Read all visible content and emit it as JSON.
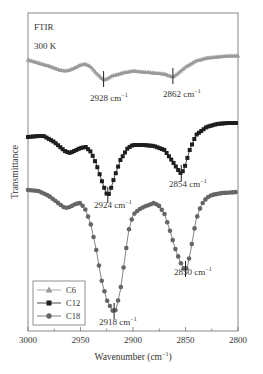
{
  "chart_data": {
    "type": "line",
    "title": "FTIR",
    "subtitle": "300 K",
    "xlabel": "Wavenumber (cm−1)",
    "ylabel": "Transmittance",
    "xlim": [
      3000,
      2800
    ],
    "x_reversed": true,
    "x_ticks": [
      3000,
      2950,
      2900,
      2850,
      2800
    ],
    "x_minor_step": 25,
    "grid": false,
    "legend_position": "lower left",
    "legend": [
      "C6",
      "C12",
      "C18"
    ],
    "series": [
      {
        "name": "C6",
        "marker": "triangle",
        "color": "#9a9a9a",
        "x": [
          3000,
          2990,
          2980,
          2970,
          2965,
          2960,
          2950,
          2945,
          2940,
          2935,
          2930,
          2928,
          2925,
          2920,
          2910,
          2900,
          2890,
          2880,
          2870,
          2865,
          2862,
          2858,
          2850,
          2840,
          2830,
          2820,
          2810,
          2800
        ],
        "y_px": [
          60,
          63,
          66,
          70,
          71,
          70,
          65,
          64,
          67,
          73,
          78,
          80,
          79,
          76,
          73,
          71,
          72,
          73,
          74,
          76,
          77,
          74,
          67,
          61,
          58,
          57,
          56,
          56
        ],
        "annotations": [
          {
            "x": 2928,
            "label": "2928 cm−1"
          },
          {
            "x": 2862,
            "label": "2862 cm−1"
          }
        ]
      },
      {
        "name": "C12",
        "marker": "square",
        "color": "#1e1e1e",
        "x": [
          3000,
          2990,
          2985,
          2975,
          2965,
          2960,
          2950,
          2945,
          2940,
          2935,
          2930,
          2926,
          2924,
          2922,
          2918,
          2912,
          2905,
          2900,
          2890,
          2880,
          2870,
          2862,
          2857,
          2854,
          2851,
          2846,
          2840,
          2830,
          2820,
          2810,
          2800
        ],
        "y_px": [
          137,
          136,
          136,
          142,
          151,
          153,
          148,
          147,
          152,
          164,
          180,
          192,
          196,
          192,
          178,
          160,
          148,
          145,
          145,
          146,
          150,
          162,
          170,
          174,
          168,
          150,
          135,
          127,
          124,
          123,
          123
        ],
        "annotations": [
          {
            "x": 2924,
            "label": "2924 cm−1"
          },
          {
            "x": 2854,
            "label": "2854 cm−1"
          }
        ]
      },
      {
        "name": "C18",
        "marker": "circle",
        "color": "#666666",
        "x": [
          3000,
          2990,
          2980,
          2970,
          2965,
          2960,
          2955,
          2950,
          2945,
          2940,
          2935,
          2930,
          2925,
          2920,
          2918,
          2916,
          2912,
          2908,
          2904,
          2900,
          2895,
          2890,
          2885,
          2880,
          2875,
          2870,
          2865,
          2860,
          2855,
          2852,
          2850,
          2848,
          2845,
          2840,
          2835,
          2830,
          2825,
          2815,
          2800
        ],
        "y_px": [
          190,
          191,
          196,
          204,
          208,
          207,
          204,
          203,
          210,
          225,
          250,
          280,
          300,
          310,
          312,
          309,
          290,
          260,
          230,
          215,
          210,
          207,
          205,
          203,
          206,
          214,
          230,
          248,
          262,
          268,
          270,
          266,
          250,
          220,
          205,
          198,
          195,
          193,
          192
        ],
        "annotations": [
          {
            "x": 2918,
            "label": "2918 cm−1"
          },
          {
            "x": 2850,
            "label": "2850 cm−1"
          }
        ]
      }
    ]
  },
  "labels": {
    "title": "FTIR",
    "temperature": "300 K",
    "ylabel": "Transmittance",
    "xlabel_main": "Wavenumber (cm",
    "xlabel_sup": "−1",
    "xlabel_close": ")",
    "ticks": [
      "3000",
      "2950",
      "2900",
      "2850",
      "2800"
    ],
    "legend": [
      "C6",
      "C12",
      "C18"
    ],
    "ann_2928": "2928 cm",
    "ann_2862": "2862 cm",
    "ann_2924": "2924 cm",
    "ann_2854": "2854 cm",
    "ann_2918": "2918 cm",
    "ann_2850": "2850 cm",
    "sup": "−1"
  }
}
